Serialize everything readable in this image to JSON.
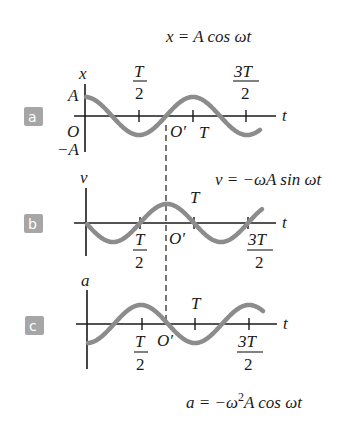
{
  "equations": {
    "x": "x = A cos ωt",
    "v": "v = −ωA sin ωt",
    "a_prefix": "a = −ω",
    "a_sup": "2",
    "a_suffix": "A cos ωt"
  },
  "panels": [
    {
      "badge": "a",
      "ylabel": "x",
      "tlabel": "t",
      "A": "A",
      "minusA": "−A",
      "origin": "O",
      "oprime": "O′",
      "T": "T",
      "half_num": "T",
      "half_den": "2",
      "three_num": "3T",
      "three_den": "2"
    },
    {
      "badge": "b",
      "ylabel": "v",
      "tlabel": "t",
      "oprime": "O′",
      "T": "T",
      "half_num": "T",
      "half_den": "2",
      "three_num": "3T",
      "three_den": "2"
    },
    {
      "badge": "c",
      "ylabel": "a",
      "tlabel": "t",
      "oprime": "O′",
      "T": "T",
      "half_num": "T",
      "half_den": "2",
      "three_num": "3T",
      "three_den": "2"
    }
  ],
  "colors": {
    "curve": "#8c8c8c",
    "axis": "#1a1a1a",
    "badge": "#a6a6a6"
  }
}
